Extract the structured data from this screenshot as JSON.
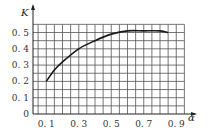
{
  "chart_data": {
    "type": "line",
    "title": "",
    "xlabel": "α",
    "ylabel": "K",
    "xlim": [
      0,
      0.95
    ],
    "ylim": [
      0,
      0.55
    ],
    "grid": true,
    "grid_step_x": 0.05,
    "grid_step_y": 0.05,
    "x_ticks": [
      "0.1",
      "0.3",
      "0.5",
      "0.7",
      "0.9"
    ],
    "y_ticks": [
      "0",
      "0.1",
      "0.2",
      "0.3",
      "0.4",
      "0.5"
    ],
    "series": [
      {
        "name": "K(α)",
        "x": [
          0.1,
          0.15,
          0.2,
          0.3,
          0.4,
          0.5,
          0.6,
          0.7,
          0.8,
          0.85
        ],
        "y": [
          0.2,
          0.27,
          0.32,
          0.4,
          0.45,
          0.49,
          0.51,
          0.51,
          0.51,
          0.5
        ]
      }
    ],
    "legend": "none"
  }
}
